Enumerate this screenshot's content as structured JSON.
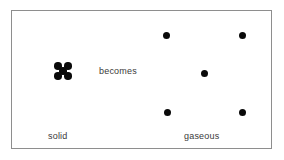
{
  "diagram": {
    "frame": {
      "border_color": "#8e8e8e",
      "background_color": "#ffffff"
    },
    "particle_color": "#0a0a0a",
    "text_color": "#3a3a3a",
    "transition_label": "becomes",
    "states": [
      {
        "id": "solid",
        "label": "solid",
        "arrangement": "tight-quincunx-cluster",
        "particle_count": 5,
        "particles": [
          {
            "x": 0,
            "y": 0
          },
          {
            "x": 10,
            "y": 0
          },
          {
            "x": 5,
            "y": 5
          },
          {
            "x": 0,
            "y": 10
          },
          {
            "x": 10,
            "y": 10
          }
        ]
      },
      {
        "id": "gaseous",
        "label": "gaseous",
        "arrangement": "widely-spaced-quincunx",
        "particle_count": 5,
        "particles": [
          {
            "x": 163,
            "y": 32
          },
          {
            "x": 239,
            "y": 32
          },
          {
            "x": 201,
            "y": 70
          },
          {
            "x": 164,
            "y": 109
          },
          {
            "x": 239,
            "y": 109
          }
        ]
      }
    ]
  }
}
